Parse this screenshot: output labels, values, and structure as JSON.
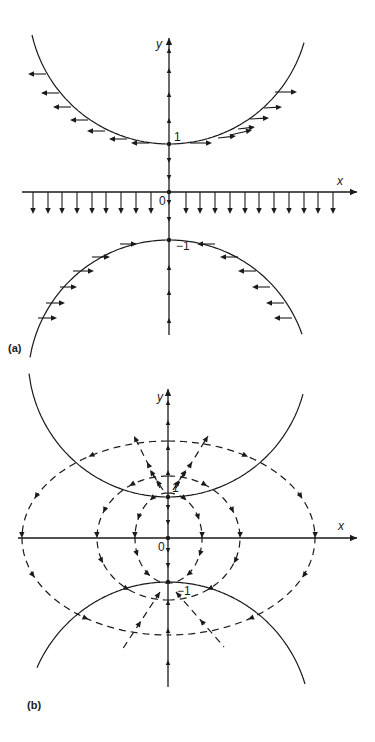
{
  "panels": [
    {
      "id": "a",
      "label": "(a)",
      "label_pos": [
        8,
        343
      ],
      "origin": [
        169,
        192
      ],
      "unit": 48,
      "x_axis": {
        "name": "x",
        "from": 22,
        "to": 357,
        "name_pos": [
          337,
          175
        ]
      },
      "y_axis": {
        "name": "y",
        "from": 335,
        "to": 38,
        "name_pos": [
          156,
          38
        ]
      },
      "tick_labels": [
        {
          "text": "1",
          "pos": [
            174,
            131
          ]
        },
        {
          "text": "0",
          "pos": [
            159,
            195
          ]
        },
        {
          "text": "−1",
          "pos": [
            176,
            240
          ]
        }
      ],
      "curves": [
        {
          "name": "upper-curve",
          "cx": 169,
          "cy": 3.4,
          "r": 140.6,
          "x_from": 32,
          "x_to": 305,
          "side": "lower"
        },
        {
          "name": "lower-curve",
          "cx": 169,
          "cy": 381,
          "r": 141,
          "x_from": 30,
          "x_to": 302,
          "side": "upper"
        }
      ],
      "dots": [
        [
          169,
          144
        ],
        [
          169,
          192
        ],
        [
          169,
          240
        ]
      ],
      "y_axis_arrows": [
        {
          "y": 48,
          "dir": "up"
        },
        {
          "y": 68,
          "dir": "up"
        },
        {
          "y": 92,
          "dir": "up"
        },
        {
          "y": 118,
          "dir": "up"
        },
        {
          "y": 163,
          "dir": "down"
        },
        {
          "y": 180,
          "dir": "down"
        },
        {
          "y": 205,
          "dir": "down"
        },
        {
          "y": 222,
          "dir": "down"
        },
        {
          "y": 265,
          "dir": "up"
        },
        {
          "y": 290,
          "dir": "up"
        },
        {
          "y": 318,
          "dir": "up"
        }
      ],
      "down_arrows_x": [
        33,
        48,
        62,
        77,
        92,
        106,
        121,
        136,
        151,
        186,
        200,
        215,
        230,
        245,
        259,
        274,
        289,
        304,
        318,
        333
      ],
      "down_arrow_len": 22,
      "tangent_arrows": [
        {
          "x0": 46,
          "y0": 74,
          "x1": 28,
          "y1": 74
        },
        {
          "x0": 59,
          "y0": 93,
          "x1": 41,
          "y1": 93
        },
        {
          "x0": 71,
          "y0": 107,
          "x1": 53,
          "y1": 107
        },
        {
          "x0": 88,
          "y0": 120,
          "x1": 70,
          "y1": 120
        },
        {
          "x0": 105,
          "y0": 131,
          "x1": 87,
          "y1": 131
        },
        {
          "x0": 127,
          "y0": 139,
          "x1": 109,
          "y1": 139
        },
        {
          "x0": 149,
          "y0": 143,
          "x1": 131,
          "y1": 143
        },
        {
          "x0": 190,
          "y0": 143,
          "x1": 212,
          "y1": 143
        },
        {
          "x0": 218,
          "y0": 138,
          "x1": 236,
          "y1": 136
        },
        {
          "x0": 230,
          "y0": 135,
          "x1": 252,
          "y1": 130
        },
        {
          "x0": 238,
          "y0": 129,
          "x1": 255,
          "y1": 127
        },
        {
          "x0": 250,
          "y0": 119,
          "x1": 269,
          "y1": 118
        },
        {
          "x0": 264,
          "y0": 108,
          "x1": 282,
          "y1": 107
        },
        {
          "x0": 275,
          "y0": 92,
          "x1": 297,
          "y1": 92
        },
        {
          "x0": 120,
          "y0": 244,
          "x1": 137,
          "y1": 244
        },
        {
          "x0": 92,
          "y0": 257,
          "x1": 110,
          "y1": 257
        },
        {
          "x0": 73,
          "y0": 271,
          "x1": 94,
          "y1": 271
        },
        {
          "x0": 60,
          "y0": 287,
          "x1": 77,
          "y1": 287
        },
        {
          "x0": 46,
          "y0": 303,
          "x1": 65,
          "y1": 303
        },
        {
          "x0": 38,
          "y0": 318,
          "x1": 57,
          "y1": 318
        },
        {
          "x0": 215,
          "y0": 244,
          "x1": 197,
          "y1": 244
        },
        {
          "x0": 238,
          "y0": 257,
          "x1": 220,
          "y1": 257
        },
        {
          "x0": 256,
          "y0": 271,
          "x1": 238,
          "y1": 271
        },
        {
          "x0": 270,
          "y0": 287,
          "x1": 252,
          "y1": 287
        },
        {
          "x0": 284,
          "y0": 303,
          "x1": 266,
          "y1": 303
        },
        {
          "x0": 292,
          "y0": 318,
          "x1": 274,
          "y1": 318
        }
      ]
    },
    {
      "id": "b",
      "label": "(b)",
      "label_pos": [
        27,
        700
      ],
      "origin": [
        168,
        538
      ],
      "unit": 44,
      "x_axis": {
        "name": "x",
        "from": 18,
        "to": 357,
        "name_pos": [
          338,
          520
        ]
      },
      "y_axis": {
        "name": "y",
        "from": 687,
        "to": 389,
        "name_pos": [
          157,
          391
        ]
      },
      "tick_labels": [
        {
          "text": "1",
          "pos": [
            172,
            482
          ]
        },
        {
          "text": "0",
          "pos": [
            158,
            541
          ]
        },
        {
          "text": "−1",
          "pos": [
            177,
            585
          ]
        }
      ],
      "curves": [
        {
          "name": "upper-curve",
          "cx": 168,
          "cy": 357,
          "r": 140,
          "x_from": 27,
          "x_to": 303,
          "side": "lower"
        },
        {
          "name": "lower-curve",
          "cx": 168,
          "cy": 725,
          "r": 143,
          "x_from": 37,
          "x_to": 306,
          "side": "upper"
        }
      ],
      "dots": [
        [
          168,
          497
        ],
        [
          168,
          538
        ],
        [
          168,
          582
        ]
      ],
      "y_axis_arrows": [
        {
          "y": 400,
          "dir": "up"
        },
        {
          "y": 420,
          "dir": "up"
        },
        {
          "y": 445,
          "dir": "up"
        },
        {
          "y": 470,
          "dir": "up"
        },
        {
          "y": 510,
          "dir": "down"
        },
        {
          "y": 525,
          "dir": "down"
        },
        {
          "y": 553,
          "dir": "down"
        },
        {
          "y": 568,
          "dir": "down"
        },
        {
          "y": 600,
          "dir": "up"
        },
        {
          "y": 628,
          "dir": "up"
        },
        {
          "y": 660,
          "dir": "up"
        }
      ],
      "dashed_loops": [
        {
          "name": "outer-loop-left",
          "cx": 168,
          "cy": 538,
          "rx": 146,
          "ry": 97,
          "side": "left"
        },
        {
          "name": "outer-loop-right",
          "cx": 168,
          "cy": 538,
          "rx": 147,
          "ry": 97,
          "side": "right"
        },
        {
          "name": "middle-loop-left",
          "cx": 168,
          "cy": 538,
          "rx": 71,
          "ry": 62,
          "side": "left"
        },
        {
          "name": "middle-loop-right",
          "cx": 168,
          "cy": 538,
          "rx": 72,
          "ry": 62,
          "side": "right"
        },
        {
          "name": "inner-loop-left",
          "cx": 168,
          "cy": 538,
          "rx": 33,
          "ry": 45,
          "side": "left"
        },
        {
          "name": "inner-loop-right",
          "cx": 168,
          "cy": 538,
          "rx": 34,
          "ry": 45,
          "side": "right"
        }
      ],
      "radial_rays": [
        {
          "x0": 160,
          "y0": 488,
          "x1": 134,
          "y1": 436
        },
        {
          "x0": 176,
          "y0": 488,
          "x1": 208,
          "y1": 436
        },
        {
          "x0": 163,
          "y0": 490,
          "x1": 150,
          "y1": 470
        },
        {
          "x0": 173,
          "y0": 490,
          "x1": 186,
          "y1": 470
        },
        {
          "x0": 160,
          "y0": 592,
          "x1": 122,
          "y1": 650
        },
        {
          "x0": 176,
          "y0": 592,
          "x1": 224,
          "y1": 647
        }
      ]
    }
  ],
  "colors": {
    "ink": "#1a1a1a",
    "paper": "#ffffff"
  }
}
